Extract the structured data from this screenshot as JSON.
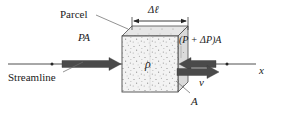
{
  "figure": {
    "labels": {
      "parcel": "Parcel",
      "thickness": "Δℓ",
      "pressure_left": "PA",
      "pressure_right": "(P + ΔP)A",
      "density": "ρ",
      "streamline": "Streamline",
      "velocity": "v",
      "area": "A",
      "axis_x": "x"
    },
    "colors": {
      "ink": "#1a1a1a",
      "line": "#3d3d3d",
      "force_arrow": "#4a4a4a",
      "parcel_face": "#f2f2f2",
      "parcel_top": "#e4e4e4",
      "parcel_side": "#d8d8d8",
      "stipple": "#8a8a8a",
      "background": "#ffffff"
    },
    "elements": {
      "parcel_shape": "stippled-3d-cube",
      "left_arrow_direction": "right",
      "right_arrow_direction": "left",
      "velocity_arrow_direction": "right",
      "dimension_line": "double-headed",
      "streamline_marker": "dot"
    }
  }
}
